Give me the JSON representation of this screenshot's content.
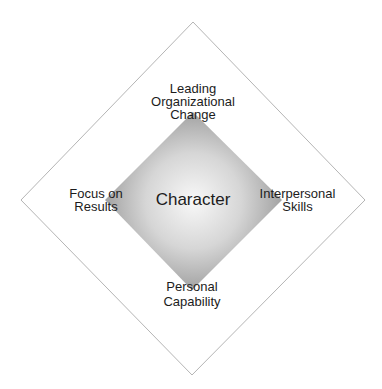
{
  "diagram": {
    "center_label": "Character",
    "labels": {
      "top": [
        "Leading",
        "Organizational",
        "Change"
      ],
      "left": [
        "Focus on",
        "Results"
      ],
      "right": [
        "Interpersonal",
        "Skills"
      ],
      "bottom": [
        "Personal",
        "Capability"
      ]
    },
    "colors": {
      "outer_border": "#b5b5b5",
      "inner_center": "#f7f7f7",
      "inner_edge": "#8a8a8a"
    }
  }
}
